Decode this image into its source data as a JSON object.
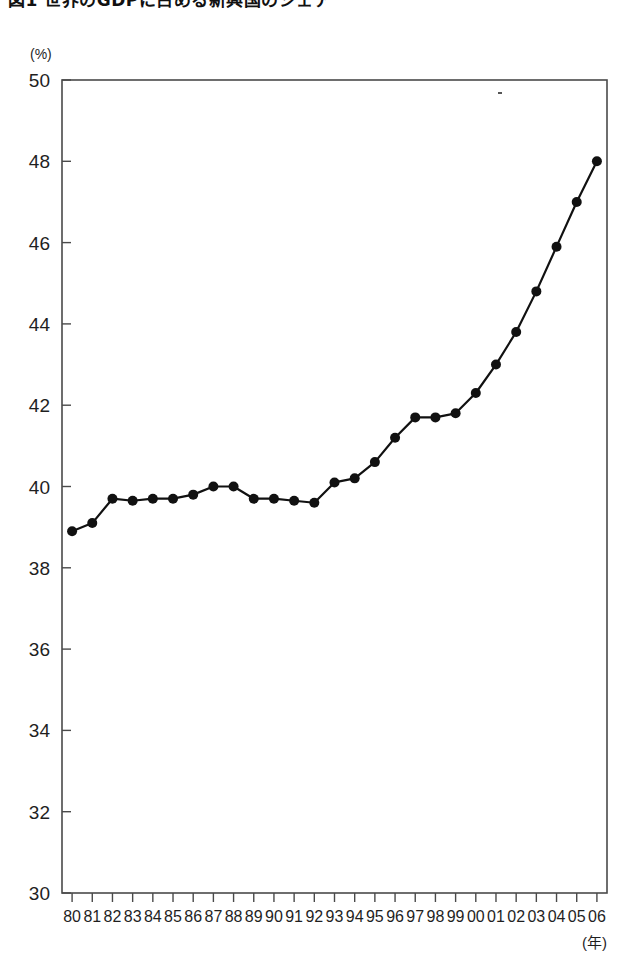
{
  "figure": {
    "title": "図1  世界のGDPに占める新興国のシェア",
    "unit_label": "(%)",
    "xaxis_unit_label": "(年)"
  },
  "chart_data": {
    "type": "line",
    "title": "図1  世界のGDPに占める新興国のシェア",
    "xlabel": "(年)",
    "ylabel": "(%)",
    "ylim": [
      30,
      50
    ],
    "ytick_values": [
      30,
      32,
      34,
      36,
      38,
      40,
      42,
      44,
      46,
      48,
      50
    ],
    "ytick_labels": [
      "30",
      "32",
      "34",
      "36",
      "38",
      "40",
      "42",
      "44",
      "46",
      "48",
      "50"
    ],
    "grid": false,
    "legend": null,
    "categories": [
      "80",
      "81",
      "82",
      "83",
      "84",
      "85",
      "86",
      "87",
      "88",
      "89",
      "90",
      "91",
      "92",
      "93",
      "94",
      "95",
      "96",
      "97",
      "98",
      "99",
      "00",
      "01",
      "02",
      "03",
      "04",
      "05",
      "06"
    ],
    "values": [
      38.9,
      39.1,
      39.7,
      39.65,
      39.7,
      39.7,
      39.8,
      40.0,
      40.0,
      39.7,
      39.7,
      39.65,
      39.6,
      40.1,
      40.2,
      40.6,
      41.2,
      41.7,
      41.7,
      41.8,
      42.3,
      43.0,
      43.8,
      44.8,
      45.9,
      47.0,
      48.0
    ],
    "marker": "filled-circle",
    "line_color": "#111111",
    "marker_color": "#111111"
  }
}
